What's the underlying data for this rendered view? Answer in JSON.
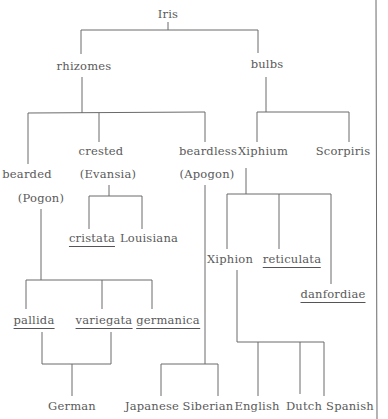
{
  "diagram": {
    "type": "taxonomy-tree",
    "root": "Iris",
    "line_color": "#6a6a6a",
    "text_color": "#5a5a5a",
    "nodes": {
      "iris": {
        "label": "Iris",
        "x": 168,
        "y": 8,
        "underlined": false
      },
      "rhizomes": {
        "label": "rhizomes",
        "x": 84,
        "y": 60,
        "underlined": false
      },
      "bulbs": {
        "label": "bulbs",
        "x": 267,
        "y": 58,
        "underlined": false
      },
      "bearded": {
        "label": "bearded",
        "x": 27,
        "y": 172,
        "underlined": false
      },
      "pogon": {
        "label": "(Pogon)",
        "x": 41,
        "y": 196,
        "underlined": false
      },
      "crested": {
        "label": "crested",
        "x": 101,
        "y": 148,
        "underlined": false
      },
      "evansia": {
        "label": "(Evansia)",
        "x": 108,
        "y": 172,
        "underlined": false
      },
      "beardless": {
        "label": "beardless",
        "x": 208,
        "y": 148,
        "underlined": false
      },
      "apogon": {
        "label": "(Apogon)",
        "x": 207,
        "y": 172,
        "underlined": false
      },
      "xiphium": {
        "label": "Xiphium",
        "x": 263,
        "y": 148,
        "underlined": false
      },
      "scorpiris": {
        "label": "Scorpiris",
        "x": 343,
        "y": 148,
        "underlined": false
      },
      "cristata": {
        "label": "cristata",
        "x": 92,
        "y": 234,
        "underlined": true
      },
      "louisiana": {
        "label": "Louisiana",
        "x": 149,
        "y": 234,
        "underlined": false
      },
      "xiphion": {
        "label": "Xiphion",
        "x": 230,
        "y": 255,
        "underlined": false
      },
      "reticulata": {
        "label": "reticulata",
        "x": 292,
        "y": 255,
        "underlined": true
      },
      "danfordiae": {
        "label": "danfordiae",
        "x": 333,
        "y": 290,
        "underlined": true
      },
      "pallida": {
        "label": "pallida",
        "x": 33,
        "y": 316,
        "underlined": true
      },
      "variegata": {
        "label": "variegata",
        "x": 104,
        "y": 316,
        "underlined": true
      },
      "germanica": {
        "label": "germanica",
        "x": 168,
        "y": 316,
        "underlined": true
      },
      "german": {
        "label": "German",
        "x": 72,
        "y": 399,
        "underlined": false
      },
      "japanese": {
        "label": "Japanese",
        "x": 152,
        "y": 399,
        "underlined": false
      },
      "siberian": {
        "label": "Siberian",
        "x": 208,
        "y": 399,
        "underlined": false
      },
      "english": {
        "label": "English",
        "x": 257,
        "y": 399,
        "underlined": false
      },
      "dutch": {
        "label": "Dutch",
        "x": 304,
        "y": 399,
        "underlined": false
      },
      "spanish": {
        "label": "Spanish",
        "x": 350,
        "y": 399,
        "underlined": false
      }
    }
  }
}
